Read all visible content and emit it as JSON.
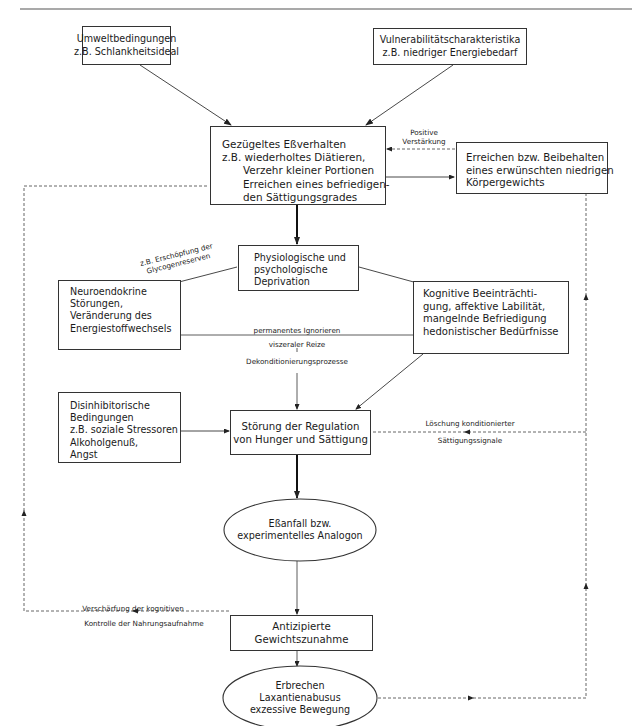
{
  "diagram": {
    "title": "",
    "nodes": {
      "umwelt": {
        "lines": [
          "Umweltbedingungen",
          "z.B. Schlankheitsideal"
        ]
      },
      "vulnerabilitaet": {
        "lines": [
          "Vulnerabilitätscharakteristika",
          "z.B. niedriger Energiebedarf"
        ]
      },
      "gezuegelt": {
        "lines": [
          "Gezügeltes Eßverhalten",
          "z.B. wiederholtes Diätieren,",
          "Verzehr kleiner Portionen",
          "Erreichen eines befriedigen-",
          "den Sättigungsgrades"
        ]
      },
      "erreichen": {
        "lines": [
          "Erreichen bzw. Beibehalten",
          "eines erwünschten niedrigen",
          "Körpergewichts"
        ]
      },
      "deprivation": {
        "lines": [
          "Physiologische und",
          "psychologische",
          "Deprivation"
        ]
      },
      "neuroendokrin": {
        "lines": [
          "Neuroendokrine",
          "Störungen,",
          "Veränderung des",
          "Energiestoffwechsels"
        ]
      },
      "kognitiv": {
        "lines": [
          "Kognitive Beeinträchti-",
          "gung, affektive Labilität,",
          "mangelnde Befriedigung",
          "hedonistischer Bedürfnisse"
        ]
      },
      "disinhibitorisch": {
        "lines": [
          "Disinhibitorische",
          "Bedingungen",
          "z.B. soziale Stressoren",
          "Alkoholgenuß,",
          "Angst"
        ]
      },
      "stoerung": {
        "lines": [
          "Störung der Regulation",
          "von Hunger und Sättigung"
        ]
      },
      "essanfall": {
        "lines": [
          "Eßanfall bzw.",
          "experimentelles Analogon"
        ]
      },
      "antizipiert": {
        "lines": [
          "Antizipierte",
          "Gewichtszunahme"
        ]
      },
      "erbrechen": {
        "lines": [
          "Erbrechen",
          "Laxantienabusus",
          "exzessive Bewegung"
        ]
      }
    },
    "edge_labels": {
      "positive": [
        "Positive",
        "Verstärkung"
      ],
      "glycogen": [
        "z.B. Erschöpfung der",
        "Glycogenreserven"
      ],
      "ignorieren": [
        "permanentes Ignorieren",
        "viszeraler Reize",
        "Dekonditionierungsprozesse"
      ],
      "loeschung": [
        "Löschung konditionierter",
        "Sättigungssignale"
      ],
      "verschaerfung": [
        "Verschärfung der kognitiven",
        "Kontrolle der Nahrungsaufnahme"
      ]
    },
    "colors": {
      "stroke": "#333333",
      "dashed": "#555555",
      "background": "#ffffff"
    }
  }
}
